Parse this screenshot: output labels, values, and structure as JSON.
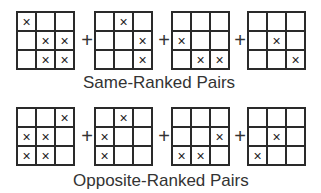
{
  "mark_glyph": "×",
  "plus_glyph": "+",
  "sections": [
    {
      "caption": "Same-Ranked Pairs",
      "grids": [
        [
          [
            1,
            0,
            0
          ],
          [
            0,
            1,
            1
          ],
          [
            0,
            1,
            1
          ]
        ],
        [
          [
            0,
            1,
            0
          ],
          [
            0,
            0,
            1
          ],
          [
            0,
            0,
            1
          ]
        ],
        [
          [
            0,
            0,
            0
          ],
          [
            1,
            0,
            0
          ],
          [
            0,
            1,
            1
          ]
        ],
        [
          [
            0,
            0,
            0
          ],
          [
            0,
            1,
            0
          ],
          [
            0,
            0,
            1
          ]
        ]
      ]
    },
    {
      "caption": "Opposite-Ranked Pairs",
      "grids": [
        [
          [
            0,
            0,
            1
          ],
          [
            1,
            1,
            0
          ],
          [
            1,
            1,
            0
          ]
        ],
        [
          [
            0,
            1,
            0
          ],
          [
            1,
            0,
            0
          ],
          [
            1,
            0,
            0
          ]
        ],
        [
          [
            0,
            0,
            0
          ],
          [
            0,
            0,
            1
          ],
          [
            1,
            1,
            0
          ]
        ],
        [
          [
            0,
            0,
            0
          ],
          [
            0,
            1,
            0
          ],
          [
            1,
            0,
            0
          ]
        ]
      ]
    }
  ]
}
